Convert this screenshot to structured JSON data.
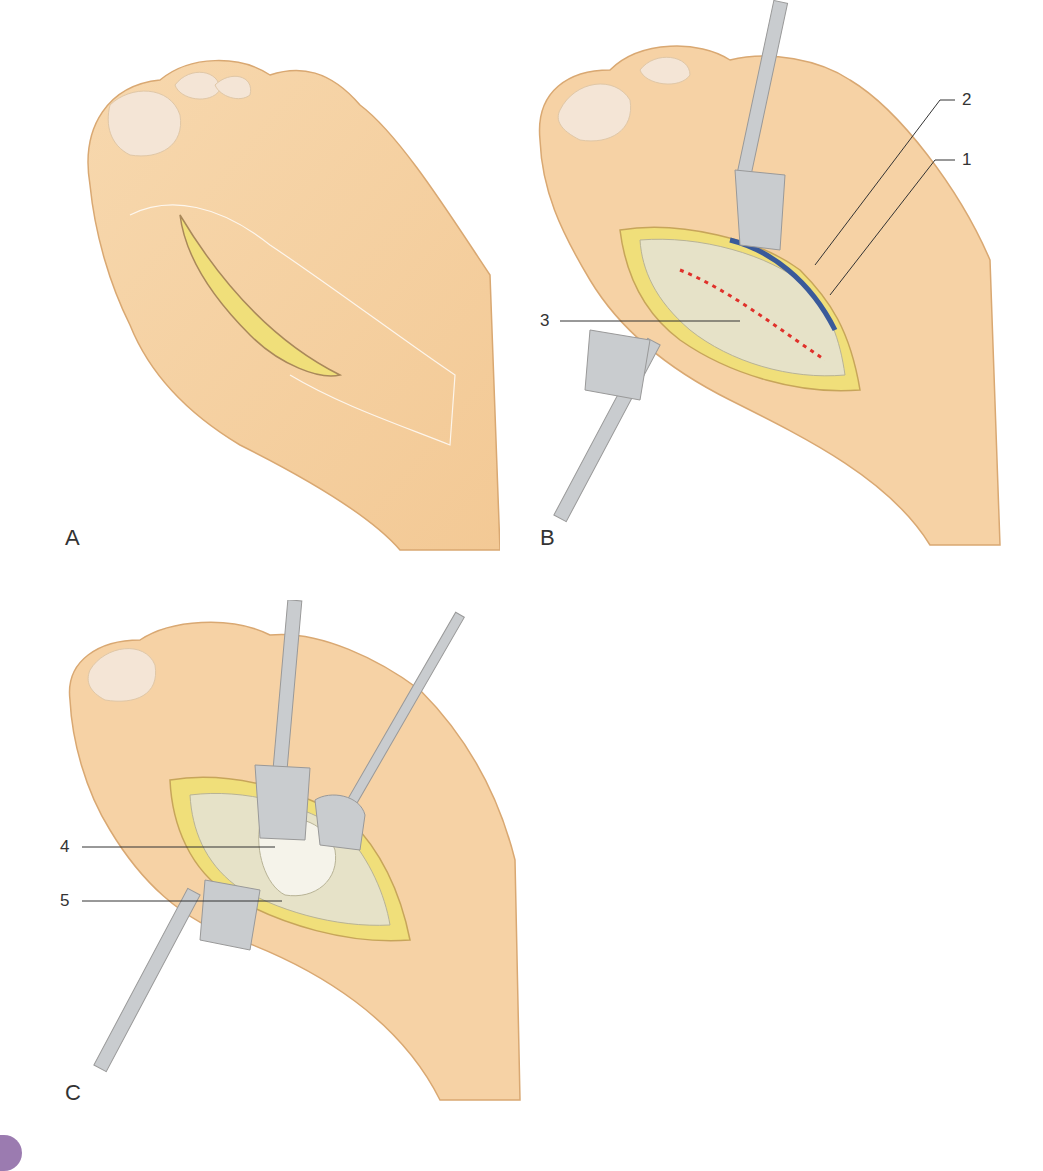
{
  "figure": {
    "panels": [
      {
        "id": "A",
        "letter": "A",
        "description": "Dorsal view of foot with medial incision line over first metatarsophalangeal joint"
      },
      {
        "id": "B",
        "letter": "B",
        "description": "Incision opened with retractors; capsule exposed with dashed capsulotomy line",
        "callouts": [
          {
            "number": "1",
            "target": "nerve (yellow)"
          },
          {
            "number": "2",
            "target": "vein (blue)"
          },
          {
            "number": "3",
            "target": "joint capsule"
          }
        ]
      },
      {
        "id": "C",
        "letter": "C",
        "description": "Capsule opened exposing metatarsal head",
        "callouts": [
          {
            "number": "4",
            "target": "metatarsal head"
          },
          {
            "number": "5",
            "target": "capsule flap"
          }
        ]
      }
    ],
    "colors": {
      "skin": "#f5d3a8",
      "skin_shadow": "#e8b884",
      "nail": "#f3e3d3",
      "tissue": "#e6e2c8",
      "fat": "#f0df7a",
      "vein": "#3a5a9a",
      "dash": "#e0302a",
      "instrument": "#c9cccf",
      "tab": "#9b7bb0"
    }
  },
  "labels": {
    "A": "A",
    "B": "B",
    "C": "C",
    "n1": "1",
    "n2": "2",
    "n3": "3",
    "n4": "4",
    "n5": "5"
  }
}
